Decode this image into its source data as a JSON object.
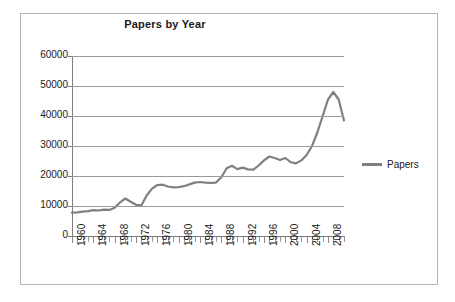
{
  "chart_data": {
    "type": "line",
    "title": "Papers by Year",
    "xlabel": "",
    "ylabel": "",
    "ylim": [
      0,
      60000
    ],
    "xlim": [
      1960,
      2011
    ],
    "grid": true,
    "legend_position": "right",
    "y_ticks": [
      0,
      10000,
      20000,
      30000,
      40000,
      50000,
      60000
    ],
    "y_tick_labels": [
      "0",
      "10000",
      "20000",
      "30000",
      "40000",
      "50000",
      "60000"
    ],
    "x_tick_labels": [
      "1960",
      "1964",
      "1968",
      "1972",
      "1976",
      "1980",
      "1984",
      "1988",
      "1992",
      "1996",
      "2000",
      "2004",
      "2008"
    ],
    "x_tick_years": [
      1960,
      1964,
      1968,
      1972,
      1976,
      1980,
      1984,
      1988,
      1992,
      1996,
      2000,
      2004,
      2008
    ],
    "series": [
      {
        "name": "Papers",
        "color": "#808080",
        "x": [
          1960,
          1961,
          1962,
          1963,
          1964,
          1965,
          1966,
          1967,
          1968,
          1969,
          1970,
          1971,
          1972,
          1973,
          1974,
          1975,
          1976,
          1977,
          1978,
          1979,
          1980,
          1981,
          1982,
          1983,
          1984,
          1985,
          1986,
          1987,
          1988,
          1989,
          1990,
          1991,
          1992,
          1993,
          1994,
          1995,
          1996,
          1997,
          1998,
          1999,
          2000,
          2001,
          2002,
          2003,
          2004,
          2005,
          2006,
          2007,
          2008,
          2009,
          2010,
          2011
        ],
        "values": [
          7800,
          7900,
          8100,
          8300,
          8600,
          8500,
          8800,
          8700,
          9400,
          11200,
          12500,
          11400,
          10400,
          10200,
          13500,
          15800,
          17000,
          17100,
          16500,
          16200,
          16300,
          16600,
          17200,
          17800,
          18000,
          17800,
          17700,
          17800,
          19600,
          22600,
          23400,
          22300,
          22800,
          22200,
          22100,
          23500,
          25200,
          26500,
          26000,
          25300,
          26000,
          24600,
          24200,
          25200,
          27000,
          30000,
          34500,
          40000,
          45500,
          48000,
          45500,
          38500
        ]
      }
    ]
  },
  "legend": {
    "entries": [
      {
        "label": "Papers",
        "color": "#808080"
      }
    ]
  }
}
